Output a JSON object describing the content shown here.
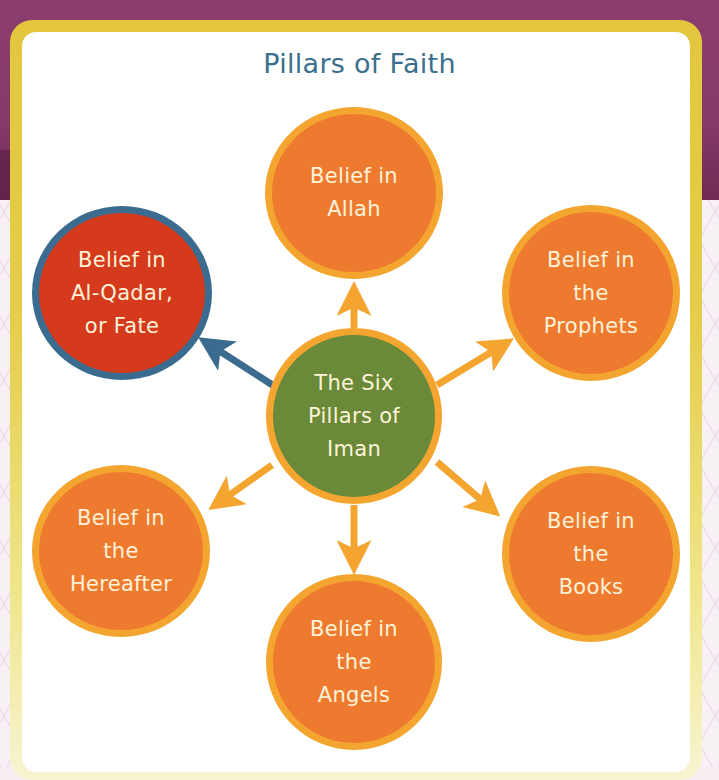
{
  "title": "Pillars of Faith",
  "center": {
    "label": "The Six\nPillars of\nIman",
    "color": "#6a8a3a"
  },
  "pillars": [
    {
      "id": "allah",
      "label": "Belief in\nAllah",
      "color": "#ee7a30"
    },
    {
      "id": "prophets",
      "label": "Belief in\nthe\nProphets",
      "color": "#ee7a30"
    },
    {
      "id": "books",
      "label": "Belief in\nthe\nBooks",
      "color": "#ee7a30"
    },
    {
      "id": "angels",
      "label": "Belief in\nthe\nAngels",
      "color": "#ee7a30"
    },
    {
      "id": "hereafter",
      "label": "Belief in\nthe\nHereafter",
      "color": "#ee7a30"
    },
    {
      "id": "fate",
      "label": "Belief in\nAl-Qadar,\nor Fate",
      "color": "#d63a1d",
      "highlighted": true
    }
  ],
  "colors": {
    "title": "#3a6f8d",
    "arrow": "#f3a530",
    "highlight_arrow": "#3b6c8f",
    "border": "#e3c63d",
    "background": "#853a69"
  }
}
